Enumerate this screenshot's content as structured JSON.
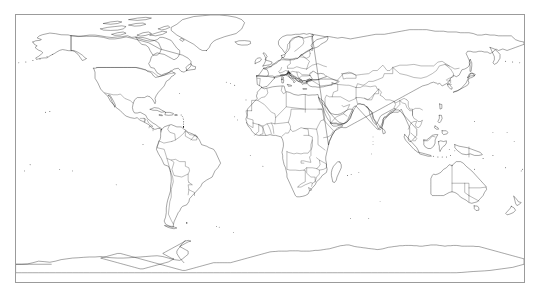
{
  "figure": {
    "type": "world-map",
    "projection": "equirectangular",
    "title": "",
    "background_color": "#ffffff",
    "frame": {
      "visible": true,
      "color": "#9b9b9b",
      "thickness_px": 1,
      "x_px": 15,
      "y_px": 14,
      "width_px": 510,
      "height_px": 269
    },
    "map": {
      "coastline_color": "#000000",
      "border_color": "#1a1a1a",
      "land_fill": "none",
      "ocean_fill": "#ffffff",
      "graticule_visible": false,
      "labels_visible": false,
      "legend_visible": false,
      "lon_range": [
        -180,
        180
      ],
      "lat_range": [
        -90,
        83
      ],
      "features": [
        "country-borders",
        "coastlines",
        "antarctica-coast",
        "islands"
      ],
      "continents": [
        "North America",
        "South America",
        "Europe",
        "Africa",
        "Asia",
        "Australia",
        "Antarctica"
      ]
    }
  }
}
